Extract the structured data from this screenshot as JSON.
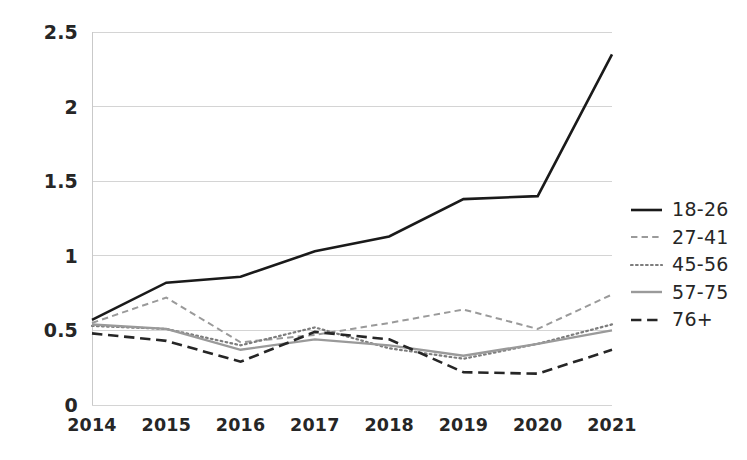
{
  "chart_data": {
    "type": "line",
    "title": "",
    "subtitle": "",
    "xlabel": "",
    "ylabel": "",
    "categories": [
      "2014",
      "2015",
      "2016",
      "2017",
      "2018",
      "2019",
      "2020",
      "2021"
    ],
    "x": [
      2014,
      2015,
      2016,
      2017,
      2018,
      2019,
      2020,
      2021
    ],
    "ylim": [
      0,
      2.5
    ],
    "yticks": [
      "0",
      "0.5",
      "1",
      "1.5",
      "2",
      "2.5"
    ],
    "ytick_values": [
      0,
      0.5,
      1,
      1.5,
      2,
      2.5
    ],
    "grid": true,
    "grid_axis": "y",
    "legend_position": "right",
    "series": [
      {
        "name": "18-26",
        "values": [
          0.57,
          0.82,
          0.86,
          1.03,
          1.13,
          1.38,
          1.4,
          2.35
        ],
        "color": "#1a1a1a",
        "style": "solid",
        "width": 2.6
      },
      {
        "name": "27-41",
        "values": [
          0.55,
          0.72,
          0.42,
          0.47,
          0.55,
          0.64,
          0.51,
          0.74
        ],
        "color": "#9a9a9a",
        "style": "dashed",
        "width": 2.0
      },
      {
        "name": "45-56",
        "values": [
          0.53,
          0.51,
          0.4,
          0.52,
          0.38,
          0.31,
          0.41,
          0.54
        ],
        "color": "#7d7d7d",
        "style": "dotted",
        "width": 2.2
      },
      {
        "name": "57-75",
        "values": [
          0.54,
          0.51,
          0.37,
          0.44,
          0.4,
          0.33,
          0.41,
          0.5
        ],
        "color": "#9a9a9a",
        "style": "solid",
        "width": 2.4
      },
      {
        "name": "76+",
        "values": [
          0.48,
          0.43,
          0.29,
          0.49,
          0.44,
          0.22,
          0.21,
          0.37
        ],
        "color": "#262626",
        "style": "longdash",
        "width": 2.6
      }
    ]
  },
  "axes": {
    "y_axis_line_color": "#c9c9c9",
    "grid_color": "#d4d4d4"
  }
}
